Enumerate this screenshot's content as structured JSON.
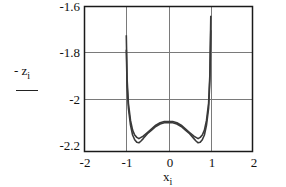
{
  "chart_data": {
    "type": "line",
    "title": "",
    "xlabel": "x",
    "xlabel_subscript": "i",
    "ylabel": "- z",
    "ylabel_subscript": "i",
    "xlim": [
      -2,
      2
    ],
    "ylim": [
      -2.2,
      -1.6
    ],
    "xticks": [
      "-2",
      "-1",
      "0",
      "1",
      "2"
    ],
    "yticks": [
      "-1.6",
      "-1.8",
      "-2",
      "-2.2"
    ],
    "grid": true,
    "legend": null,
    "series": [
      {
        "name": "curve-1",
        "x": [
          -1.0,
          -0.98,
          -0.95,
          -0.9,
          -0.85,
          -0.8,
          -0.75,
          -0.7,
          -0.65,
          -0.6,
          -0.5,
          -0.4,
          -0.3,
          -0.2,
          -0.1,
          0.0,
          0.1,
          0.2,
          0.3,
          0.4,
          0.5,
          0.6,
          0.65,
          0.7,
          0.75,
          0.8,
          0.85,
          0.9,
          0.95,
          0.98,
          1.0
        ],
        "y": [
          -1.72,
          -1.9,
          -2.0,
          -2.07,
          -2.11,
          -2.13,
          -2.14,
          -2.145,
          -2.14,
          -2.135,
          -2.12,
          -2.105,
          -2.09,
          -2.08,
          -2.075,
          -2.075,
          -2.075,
          -2.08,
          -2.09,
          -2.105,
          -2.12,
          -2.135,
          -2.14,
          -2.145,
          -2.14,
          -2.13,
          -2.11,
          -2.07,
          -2.0,
          -1.88,
          -1.64
        ]
      },
      {
        "name": "curve-2",
        "x": [
          -1.0,
          -0.98,
          -0.95,
          -0.9,
          -0.85,
          -0.8,
          -0.75,
          -0.7,
          -0.65,
          -0.6,
          -0.5,
          -0.4,
          -0.3,
          -0.2,
          -0.1,
          0.0,
          0.1,
          0.2,
          0.3,
          0.4,
          0.5,
          0.6,
          0.65,
          0.7,
          0.75,
          0.8,
          0.85,
          0.9,
          0.95,
          0.98,
          1.0
        ],
        "y": [
          -1.78,
          -1.93,
          -2.02,
          -2.09,
          -2.13,
          -2.15,
          -2.16,
          -2.162,
          -2.155,
          -2.145,
          -2.125,
          -2.11,
          -2.095,
          -2.085,
          -2.08,
          -2.08,
          -2.08,
          -2.085,
          -2.095,
          -2.11,
          -2.125,
          -2.145,
          -2.155,
          -2.162,
          -2.16,
          -2.15,
          -2.13,
          -2.09,
          -2.02,
          -1.9,
          -1.7
        ]
      }
    ],
    "colors": {
      "frame": "#1a1a1a",
      "grid": "#7a7a7a",
      "series": "#3a3a3a"
    }
  },
  "axes": {
    "y_ticks": [
      {
        "label": "-1.6"
      },
      {
        "label": "-1.8"
      },
      {
        "label": "-2"
      },
      {
        "label": "-2.2"
      }
    ],
    "x_ticks": [
      {
        "label": "-2"
      },
      {
        "label": "-1"
      },
      {
        "label": "0"
      },
      {
        "label": "1"
      },
      {
        "label": "2"
      }
    ],
    "ylabel": {
      "main": "- z",
      "sub": "i"
    },
    "xlabel": {
      "main": "x",
      "sub": "i"
    }
  }
}
